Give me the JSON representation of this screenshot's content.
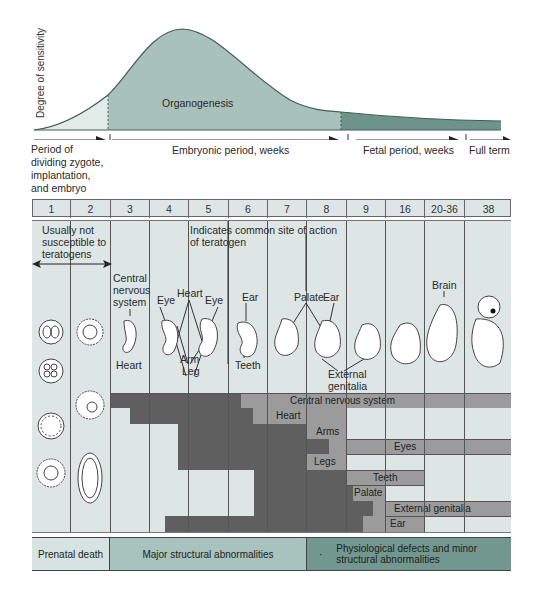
{
  "curve": {
    "y_axis_label": "Degree of sensitivity",
    "organogenesis_label": "Organogenesis"
  },
  "periods": {
    "dividing": "Period of\ndividing zygote,\nimplantation,\nand embryo",
    "dividing_lines": [
      "Period of",
      "dividing zygote,",
      "implantation,",
      "and embryo"
    ],
    "embryonic": "Embryonic period, weeks",
    "fetal": "Fetal period, weeks",
    "full_term": "Full term"
  },
  "weeks": [
    "1",
    "2",
    "3",
    "4",
    "5",
    "6",
    "7",
    "8",
    "9",
    "16",
    "20-36",
    "38"
  ],
  "annotations": {
    "not_susceptible_lines": [
      "Usually not",
      "susceptible to",
      "teratogens"
    ],
    "teratogen_site_lines": [
      "Indicates common site of action",
      "of teratogen"
    ],
    "cns_lines": [
      "Central",
      "nervous",
      "system"
    ],
    "heart_top": "Heart",
    "eye_left": "Eye",
    "eye_right": "Eye",
    "ear_6": "Ear",
    "palate": "Palate",
    "ear_8": "Ear",
    "brain": "Brain",
    "heart_bottom": "Heart",
    "arm": "Arm",
    "leg": "Leg",
    "teeth": "Teeth",
    "external_genitalia_lines": [
      "External",
      "genitalia"
    ]
  },
  "sensitivity_rows": [
    {
      "label": "Central nervous system"
    },
    {
      "label": "Heart"
    },
    {
      "label": "Arms"
    },
    {
      "label": "Eyes"
    },
    {
      "label": "Legs"
    },
    {
      "label": "Teeth"
    },
    {
      "label": "Palate"
    },
    {
      "label": "External genitalia"
    },
    {
      "label": "Ear"
    }
  ],
  "footer": {
    "prenatal_death": "Prenatal death",
    "major": "Major structural abnormalities",
    "minor_lines": [
      "Physiological defects and minor",
      "structural abnormalities"
    ],
    "bullet": "·"
  },
  "colors": {
    "curve_light": "#dde6e4",
    "curve_mid": "#a9c0bb",
    "curve_dark": "#6b9089",
    "curve_stroke": "#3e5f58",
    "panel_bg": "#dde6e5",
    "dark_bar": "#5e5e5e",
    "light_bar": "#9a9a9a",
    "footer_light": "#d5e2e0",
    "footer_mid": "#a6c1bb",
    "footer_dark": "#6f968e"
  }
}
